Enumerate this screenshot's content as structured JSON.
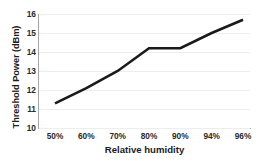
{
  "chart_data": {
    "type": "line",
    "title": "",
    "xlabel": "Relative humidity",
    "ylabel": "Threshold Power (dBm)",
    "categories": [
      "50%",
      "60%",
      "70%",
      "80%",
      "90%",
      "94%",
      "96%"
    ],
    "values": [
      11.3,
      12.1,
      13.0,
      14.2,
      14.2,
      15.0,
      15.7
    ],
    "series": [
      {
        "name": "Threshold Power",
        "values": [
          11.3,
          12.1,
          13.0,
          14.2,
          14.2,
          15.0,
          15.7
        ]
      }
    ],
    "ylim": [
      10,
      16
    ],
    "yticks": [
      10,
      11,
      12,
      13,
      14,
      15,
      16
    ],
    "ytick_labels": [
      "10",
      "11",
      "12",
      "13",
      "14",
      "15",
      "16"
    ],
    "xtick_labels": [
      "50%",
      "60%",
      "70%",
      "80%",
      "90%",
      "94%",
      "96%"
    ],
    "grid": true,
    "grid_axis": "y",
    "legend": false,
    "legend_position": "none",
    "line_color": "#1a1a1a",
    "grid_color": "#ededed",
    "axis_color": "#a6a6a6",
    "background_color": "#ffffff",
    "markers": false
  }
}
